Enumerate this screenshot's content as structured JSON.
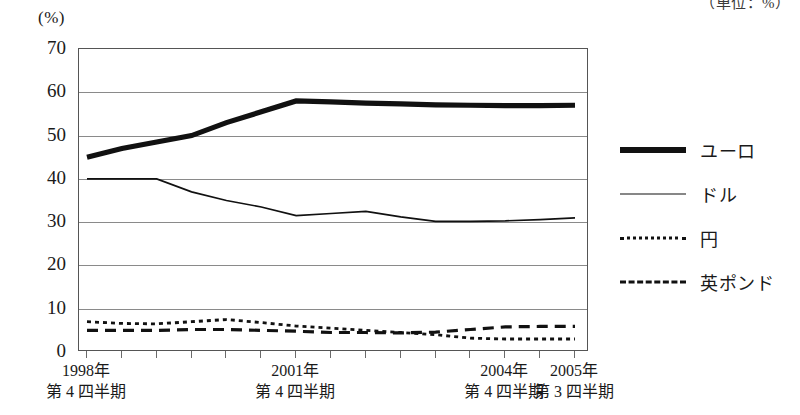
{
  "unit_caption": "（単位：%）",
  "axis_unit": "(%)",
  "chart_data": {
    "type": "line",
    "title": "",
    "subtitle": "",
    "xlabel": "",
    "ylabel": "(%)",
    "unit_note": "（単位：%）",
    "ylim": [
      0,
      70
    ],
    "ytick_step": 10,
    "yticks": [
      70,
      60,
      50,
      40,
      30,
      20,
      10,
      0
    ],
    "grid": true,
    "legend_position": "right",
    "x": [
      "1998Q4",
      "1999Q2",
      "1999Q4",
      "2000Q2",
      "2000Q4",
      "2001Q2",
      "2001Q4",
      "2002Q2",
      "2002Q4",
      "2003Q2",
      "2003Q4",
      "2004Q2",
      "2004Q4",
      "2005Q1",
      "2005Q3"
    ],
    "xtick_labels": [
      {
        "year": "1998年",
        "quarter": "第 4 四半期",
        "index": 0
      },
      {
        "year": "2001年",
        "quarter": "第 4 四半期",
        "index": 6
      },
      {
        "year": "2004年",
        "quarter": "第 4 四半期",
        "index": 12
      },
      {
        "year": "2005年",
        "quarter": "第 3 四半期",
        "index": 14
      }
    ],
    "series": [
      {
        "name": "ユーロ",
        "style": "thick-solid",
        "values": [
          45.0,
          47.0,
          48.5,
          50.0,
          53.0,
          55.5,
          58.0,
          57.8,
          57.5,
          57.3,
          57.1,
          57.0,
          56.9,
          56.9,
          57.0
        ]
      },
      {
        "name": "ドル",
        "style": "thin-solid",
        "values": [
          40.0,
          40.0,
          40.0,
          37.0,
          35.0,
          33.5,
          31.5,
          32.0,
          32.5,
          31.2,
          30.2,
          30.2,
          30.3,
          30.6,
          31.0
        ]
      },
      {
        "name": "円",
        "style": "dotted",
        "values": [
          7.0,
          6.6,
          6.5,
          7.0,
          7.5,
          6.8,
          6.0,
          5.5,
          5.0,
          4.5,
          4.0,
          3.2,
          3.0,
          3.0,
          3.0
        ]
      },
      {
        "name": "英ポンド",
        "style": "dashed",
        "values": [
          5.0,
          5.0,
          5.0,
          5.2,
          5.2,
          5.0,
          4.8,
          4.5,
          4.5,
          4.4,
          4.6,
          5.2,
          5.8,
          5.9,
          5.9
        ]
      }
    ]
  },
  "legend": {
    "items": [
      {
        "label": "ユーロ",
        "style": "thick-solid"
      },
      {
        "label": "ドル",
        "style": "thin-solid"
      },
      {
        "label": "円",
        "style": "dotted"
      },
      {
        "label": "英ポンド",
        "style": "dashed"
      }
    ]
  }
}
